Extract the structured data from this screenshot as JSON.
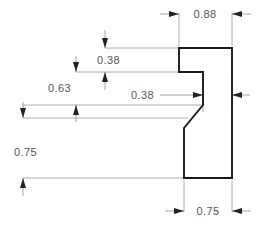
{
  "drawing": {
    "type": "engineering-section-profile",
    "title": "Molding profile cross-section with dimensions",
    "units": "inches",
    "canvas": {
      "width": 273,
      "height": 228
    },
    "colors": {
      "background": "#ffffff",
      "profile_stroke": "#1a1a1a",
      "dimension_line": "#8e8e8e",
      "extension_line": "#9a9a9a",
      "dimension_text": "#555555",
      "arrow_fill": "#222222"
    },
    "profile": {
      "name": "profile-outline",
      "closed": true,
      "points": [
        [
          179,
          48
        ],
        [
          232,
          48
        ],
        [
          232,
          178
        ],
        [
          184,
          178
        ],
        [
          184,
          128
        ],
        [
          203,
          105
        ],
        [
          203,
          72
        ],
        [
          179,
          72
        ]
      ]
    },
    "dimensions": [
      {
        "id": "dim-width-088",
        "label": "0.88",
        "orientation": "horizontal",
        "value": 0.88,
        "placement": "top",
        "text_x": 205,
        "text_y": 17,
        "dim_line_y": 14,
        "from_x": 179,
        "to_x": 232,
        "arrows": "outside",
        "ext_from": {
          "x": 179,
          "y1": 14,
          "y2": 46
        },
        "ext_to": {
          "x": 232,
          "y1": 14,
          "y2": 46
        }
      },
      {
        "id": "dim-width-075",
        "label": "0.75",
        "orientation": "horizontal",
        "value": 0.75,
        "placement": "bottom",
        "text_x": 208,
        "text_y": 215,
        "dim_line_y": 211,
        "from_x": 184,
        "to_x": 232,
        "arrows": "outside",
        "ext_from": {
          "x": 184,
          "y1": 180,
          "y2": 211
        },
        "ext_to": {
          "x": 232,
          "y1": 180,
          "y2": 211
        }
      },
      {
        "id": "dim-width-038",
        "label": "0.38",
        "orientation": "horizontal",
        "value": 0.38,
        "placement": "middle-right",
        "text_x": 131,
        "text_y": 99,
        "dim_line_y": 95,
        "from_x": 203,
        "to_x": 232,
        "arrows": "outside",
        "leader_from_x": 158,
        "leader_to_x": 203,
        "ext_from": {
          "x": 203,
          "y1": 74,
          "y2": 112
        },
        "ext_to": {
          "x": 232,
          "y1": 74,
          "y2": 112
        }
      },
      {
        "id": "dim-height-038",
        "label": "0.38",
        "orientation": "vertical",
        "value": 0.38,
        "text_x": 97,
        "text_y": 64,
        "dim_line_x": 105,
        "from_y": 48,
        "to_y": 72,
        "arrows": "outside",
        "ext_top": {
          "y": 48,
          "x1": 105,
          "x2": 179
        },
        "ext_bottom": {
          "y": 72,
          "x1": 76,
          "x2": 179
        }
      },
      {
        "id": "dim-height-063",
        "label": "0.63",
        "orientation": "vertical",
        "value": 0.63,
        "text_x": 48,
        "text_y": 91,
        "dim_line_x": 76,
        "from_y": 72,
        "to_y": 105,
        "arrows": "outside",
        "ext_top": {
          "y": 72,
          "x1": 76,
          "x2": 179
        },
        "ext_bottom": {
          "y": 105,
          "x1": 23,
          "x2": 203
        }
      },
      {
        "id": "dim-height-075",
        "label": "0.75",
        "orientation": "vertical",
        "value": 0.75,
        "text_x": 14,
        "text_y": 155,
        "dim_line_x": 23,
        "from_y": 118,
        "to_y": 178,
        "arrows": "outside",
        "ext_top": {
          "y": 118,
          "x1": 23,
          "x2": 186
        },
        "ext_bottom": {
          "y": 178,
          "x1": 23,
          "x2": 184
        }
      }
    ]
  }
}
